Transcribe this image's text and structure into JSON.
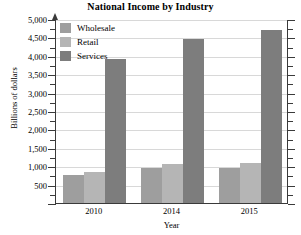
{
  "chart_data": {
    "type": "bar",
    "title": "National Income by Industry",
    "xlabel": "Year",
    "ylabel": "Billions of dollars",
    "categories": [
      "2010",
      "2014",
      "2015"
    ],
    "series": [
      {
        "name": "Wholesale",
        "color": "#9e9e9e",
        "values": [
          750,
          950,
          950
        ]
      },
      {
        "name": "Retail",
        "color": "#b5b5b5",
        "values": [
          850,
          1050,
          1080
        ]
      },
      {
        "name": "Services",
        "color": "#7d7d7d",
        "values": [
          3900,
          4450,
          4700
        ]
      }
    ],
    "ylim": [
      0,
      5000
    ],
    "ytick_step": 500,
    "yticks": [
      0,
      500,
      1000,
      1500,
      2000,
      2500,
      3000,
      3500,
      4000,
      4500,
      5000
    ],
    "ytick_labels": [
      "",
      "500",
      "1,000",
      "1,500",
      "2,000",
      "2,500",
      "3,000",
      "3,500",
      "4,000",
      "4,500",
      "5,000"
    ],
    "minor_ticks": true,
    "grid": true,
    "grid_axis": "y",
    "legend_position": "top-left",
    "legend_entries": [
      "Wholesale",
      "Retail",
      "Services"
    ]
  },
  "style": {
    "grid_color": "#d8d8d8",
    "axis_color": "#3a3a3a",
    "text_color": "#000000",
    "background": "#ffffff"
  }
}
